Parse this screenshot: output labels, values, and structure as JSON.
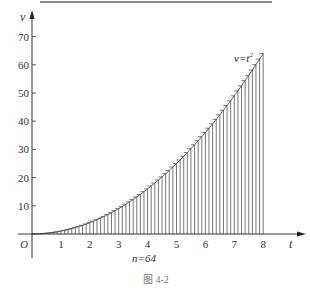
{
  "chart_data": {
    "type": "bar",
    "title": "",
    "caption": "图 4-2",
    "xlabel": "t",
    "ylabel": "v",
    "origin_label": "O",
    "curve_label": "v=t²",
    "annotation": "n=64",
    "n": 64,
    "function": "v = t^2",
    "xlim": [
      0,
      8
    ],
    "ylim": [
      0,
      70
    ],
    "x_ticks": [
      "1",
      "2",
      "3",
      "4",
      "5",
      "6",
      "7",
      "8"
    ],
    "y_ticks": [
      "10",
      "20",
      "30",
      "40",
      "50",
      "60",
      "70"
    ],
    "grid": false,
    "legend": "none",
    "bar_width": 0.125,
    "x": [
      0.125,
      0.25,
      0.375,
      0.5,
      0.625,
      0.75,
      0.875,
      1,
      1.125,
      1.25,
      1.375,
      1.5,
      1.625,
      1.75,
      1.875,
      2,
      2.125,
      2.25,
      2.375,
      2.5,
      2.625,
      2.75,
      2.875,
      3,
      3.125,
      3.25,
      3.375,
      3.5,
      3.625,
      3.75,
      3.875,
      4,
      4.125,
      4.25,
      4.375,
      4.5,
      4.625,
      4.75,
      4.875,
      5,
      5.125,
      5.25,
      5.375,
      5.5,
      5.625,
      5.75,
      5.875,
      6,
      6.125,
      6.25,
      6.375,
      6.5,
      6.625,
      6.75,
      6.875,
      7,
      7.125,
      7.25,
      7.375,
      7.5,
      7.625,
      7.75,
      7.875,
      8
    ],
    "values": [
      0.016,
      0.063,
      0.141,
      0.25,
      0.391,
      0.563,
      0.766,
      1,
      1.266,
      1.563,
      1.891,
      2.25,
      2.641,
      3.063,
      3.516,
      4,
      4.516,
      5.063,
      5.641,
      6.25,
      6.891,
      7.563,
      8.266,
      9,
      9.766,
      10.563,
      11.391,
      12.25,
      13.141,
      14.063,
      15.016,
      16,
      17.016,
      18.063,
      19.141,
      20.25,
      21.391,
      22.563,
      23.766,
      25,
      26.266,
      27.563,
      28.891,
      30.25,
      31.641,
      33.063,
      34.516,
      36,
      37.516,
      39.063,
      40.641,
      42.25,
      43.891,
      45.563,
      47.266,
      49,
      50.766,
      52.563,
      54.391,
      56.25,
      58.141,
      60.063,
      62.016,
      64
    ]
  }
}
